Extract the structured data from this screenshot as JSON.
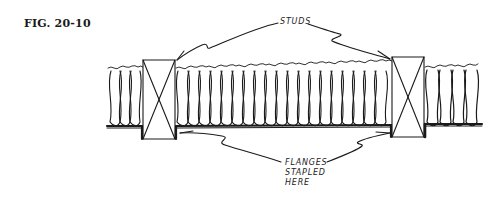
{
  "figure": {
    "label": "FIG. 20-10",
    "callouts": {
      "studs": "STUDS",
      "flanges": [
        "FLANGES",
        "STAPLED",
        "HERE"
      ]
    },
    "elements": {
      "studs": [
        {
          "name": "left-stud",
          "x": 143,
          "y": 60,
          "width": 32,
          "height": 79
        },
        {
          "name": "right-stud",
          "x": 392,
          "y": 57,
          "width": 32,
          "height": 80
        }
      ],
      "insulation": {
        "left": 108,
        "right": 481,
        "top": 67,
        "bottom": 126,
        "type": "batt insulation with flanges"
      }
    },
    "colors": {
      "ink": "#1a1a1a",
      "background": "#ffffff"
    }
  }
}
